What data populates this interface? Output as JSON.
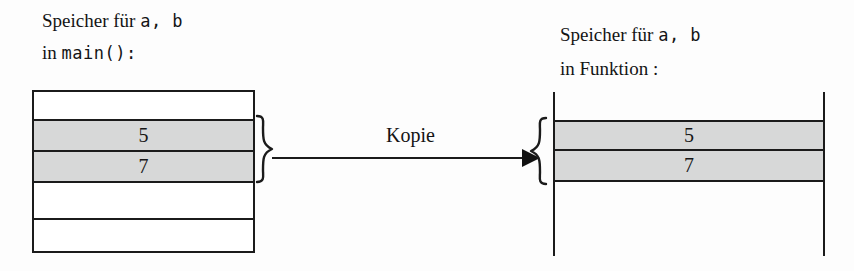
{
  "figure": {
    "background_color": "#fdfdfd",
    "line_color": "#1b1b1b",
    "shade_color": "#d7d8d8"
  },
  "left": {
    "caption_line1_prefix": "Speicher für ",
    "caption_line1_vars": "a, b",
    "caption_line2_prefix": "in ",
    "caption_line2_code": "main():",
    "cells": [
      {
        "value": "",
        "shaded": false
      },
      {
        "value": "5",
        "shaded": true
      },
      {
        "value": "7",
        "shaded": true
      },
      {
        "value": "",
        "shaded": false
      },
      {
        "value": "",
        "shaded": false
      }
    ]
  },
  "right": {
    "caption_line1_prefix": "Speicher für ",
    "caption_line1_vars": "a, b",
    "caption_line2": "in Funktion :",
    "cells": [
      {
        "value": "5",
        "shaded": true
      },
      {
        "value": "7",
        "shaded": true
      }
    ]
  },
  "connector": {
    "label": "Kopie",
    "direction": "left-to-right",
    "arrowhead": "filled-triangle"
  }
}
